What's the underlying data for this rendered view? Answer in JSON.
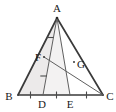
{
  "figure": {
    "type": "geometry-diagram",
    "shape": "triangle-with-cevians",
    "background_color": "#ffffff",
    "stroke_color": "#3a3a3a",
    "thin_stroke_color": "#6b6b6b",
    "shaded_region_color": "#eceaea",
    "label_color": "#1a1a1a",
    "points": [
      {
        "id": "A",
        "label": "A",
        "x": 57,
        "y": 18,
        "label_x": 57,
        "label_y": 10
      },
      {
        "id": "B",
        "label": "B",
        "x": 18,
        "y": 95,
        "label_x": 9,
        "label_y": 99
      },
      {
        "id": "C",
        "label": "C",
        "x": 103,
        "y": 95,
        "label_x": 109,
        "label_y": 99
      },
      {
        "id": "D",
        "label": "D",
        "x": 43,
        "y": 95,
        "label_x": 43,
        "label_y": 107
      },
      {
        "id": "E",
        "label": "E",
        "x": 70,
        "y": 95,
        "label_x": 70,
        "label_y": 107
      },
      {
        "id": "F",
        "label": "F",
        "x": 44,
        "y": 57,
        "label_x": 38,
        "label_y": 59
      },
      {
        "id": "G",
        "label": "G",
        "x": 74,
        "y": 62,
        "label_x": 80,
        "label_y": 66
      }
    ],
    "segments": [
      {
        "id": "AB",
        "from": "A",
        "to": "B",
        "weight": "thick"
      },
      {
        "id": "AC",
        "from": "A",
        "to": "C",
        "weight": "thick"
      },
      {
        "id": "BC",
        "from": "B",
        "to": "C",
        "weight": "thick"
      },
      {
        "id": "AD",
        "from": "A",
        "to": "D",
        "weight": "thin"
      },
      {
        "id": "AE",
        "from": "A",
        "to": "E",
        "weight": "thin"
      },
      {
        "id": "FC",
        "from": "F",
        "to": "C",
        "weight": "thin"
      }
    ],
    "shaded_region": {
      "id": "region-ABD",
      "vertices": [
        "A",
        "B",
        "D"
      ]
    },
    "tick_marks": [
      {
        "id": "tick-BD",
        "on": "BC",
        "between": [
          "B",
          "D"
        ],
        "count": 1
      },
      {
        "id": "tick-DE",
        "on": "BC",
        "between": [
          "D",
          "E"
        ],
        "count": 1
      },
      {
        "id": "tick-EC",
        "on": "BC",
        "between": [
          "E",
          "C"
        ],
        "count": 1
      },
      {
        "id": "tick-AF",
        "on": "AD",
        "between": [
          "A",
          "F"
        ],
        "count": 1
      },
      {
        "id": "tick-FD",
        "on": "AD",
        "between": [
          "F",
          "D"
        ],
        "count": 1
      }
    ],
    "relations": {
      "equal_base_segments": "BD = DE = EC",
      "equal_cevian_segments": "AF = FD",
      "intersection": "G is the intersection of FC and AE"
    }
  }
}
